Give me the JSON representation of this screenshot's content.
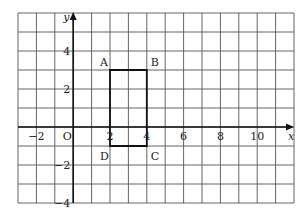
{
  "diagram": {
    "type": "coordinate-grid",
    "x_range": [
      -3,
      12
    ],
    "y_range": [
      -4,
      6
    ],
    "axes": {
      "x_label": "x",
      "y_label": "y",
      "origin_label": "O"
    },
    "x_ticks": [
      {
        "value": -2,
        "label": "−2"
      },
      {
        "value": 2,
        "label": "2"
      },
      {
        "value": 4,
        "label": "4"
      },
      {
        "value": 6,
        "label": "6"
      },
      {
        "value": 8,
        "label": "8"
      },
      {
        "value": 10,
        "label": "10"
      }
    ],
    "y_ticks": [
      {
        "value": 4,
        "label": "4"
      },
      {
        "value": 2,
        "label": "2"
      },
      {
        "value": -2,
        "label": "−2"
      },
      {
        "value": -4,
        "label": "−4"
      }
    ],
    "rectangle": {
      "vertices": [
        {
          "name": "A",
          "x": 2,
          "y": 3
        },
        {
          "name": "B",
          "x": 4,
          "y": 3
        },
        {
          "name": "C",
          "x": 4,
          "y": -1
        },
        {
          "name": "D",
          "x": 2,
          "y": -1
        }
      ]
    }
  }
}
